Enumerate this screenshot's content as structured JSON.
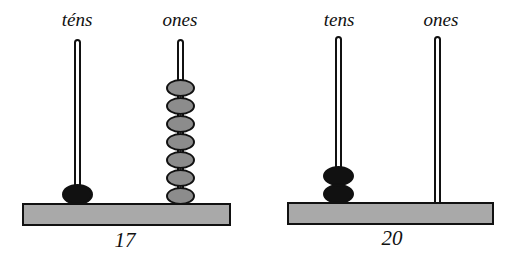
{
  "abaci": [
    {
      "value_label": "17",
      "tens": {
        "label": "téns",
        "beads": 1,
        "bead_color": "#111111"
      },
      "ones": {
        "label": "ones",
        "beads": 7,
        "bead_color": "#8c8c8c"
      }
    },
    {
      "value_label": "20",
      "tens": {
        "label": "tens",
        "beads": 2,
        "bead_color": "#111111"
      },
      "ones": {
        "label": "ones",
        "beads": 0,
        "bead_color": "#8c8c8c"
      }
    }
  ]
}
